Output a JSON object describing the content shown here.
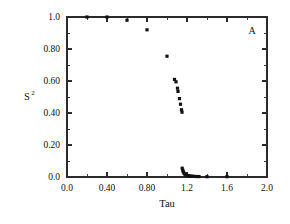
{
  "figure": {
    "panel_label": "A",
    "background_color": "#ffffff",
    "marker_color": "#111111",
    "axis_color": "#2b2b2b"
  },
  "chart_data": {
    "type": "scatter",
    "title": "",
    "subtitle": "",
    "annotations": [
      "A"
    ],
    "xlabel": "Tau",
    "ylabel": "S2",
    "ylabel_display": "S",
    "ylabel_superscript": "2",
    "xlim": [
      0.0,
      2.0
    ],
    "ylim": [
      0.0,
      1.0
    ],
    "grid": false,
    "legend": null,
    "legend_position": "none",
    "xticks": [
      0.0,
      0.4,
      0.8,
      1.2,
      1.6,
      2.0
    ],
    "xticklabels": [
      "0.0",
      "0.40",
      "0.80",
      "1.2",
      "1.6",
      "2.0"
    ],
    "yticks": [
      0.0,
      0.2,
      0.4,
      0.6,
      0.8,
      1.0
    ],
    "yticklabels": [
      "0.0",
      "0.20",
      "0.40",
      "0.60",
      "0.80",
      "1.0"
    ],
    "x_minor_tick_step": 0.2,
    "y_minor_tick_step": 0.1,
    "series": [
      {
        "name": "S2 vs Tau",
        "marker": "filled-square",
        "x": [
          0.2,
          0.4,
          0.6,
          0.8,
          1.0,
          1.075,
          1.09,
          1.105,
          1.11,
          1.125,
          1.135,
          1.145,
          1.15,
          1.152,
          1.158,
          1.163,
          1.17,
          1.178,
          1.188,
          1.2,
          1.215,
          1.232,
          1.25,
          1.27,
          1.295,
          1.32,
          1.4,
          1.6
        ],
        "y": [
          1.0,
          1.0,
          0.98,
          0.92,
          0.755,
          0.61,
          0.595,
          0.555,
          0.535,
          0.49,
          0.455,
          0.42,
          0.405,
          0.055,
          0.042,
          0.032,
          0.024,
          0.018,
          0.013,
          0.01,
          0.008,
          0.006,
          0.005,
          0.004,
          0.003,
          0.003,
          0.002,
          0.002
        ]
      }
    ]
  }
}
